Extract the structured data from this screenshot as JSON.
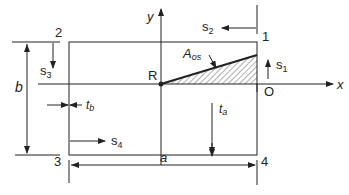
{
  "diagram": {
    "axes": {
      "x_label": "x",
      "y_label": "y"
    },
    "points": {
      "origin_R": "R",
      "origin_O": "O",
      "corner_1": "1",
      "corner_2": "2",
      "corner_3": "3",
      "corner_4": "4"
    },
    "coordinates": {
      "s1": "s",
      "s1_sub": "1",
      "s2": "s",
      "s2_sub": "2",
      "s3": "s",
      "s3_sub": "3",
      "s4": "s",
      "s4_sub": "4"
    },
    "area": {
      "label": "A",
      "sub": "os"
    },
    "dimensions": {
      "width": "a",
      "height": "b",
      "thickness_b": "t",
      "thickness_b_sub": "b",
      "thickness_a": "t",
      "thickness_a_sub": "a"
    },
    "colors": {
      "line": "#222222",
      "background": "#ffffff"
    }
  }
}
